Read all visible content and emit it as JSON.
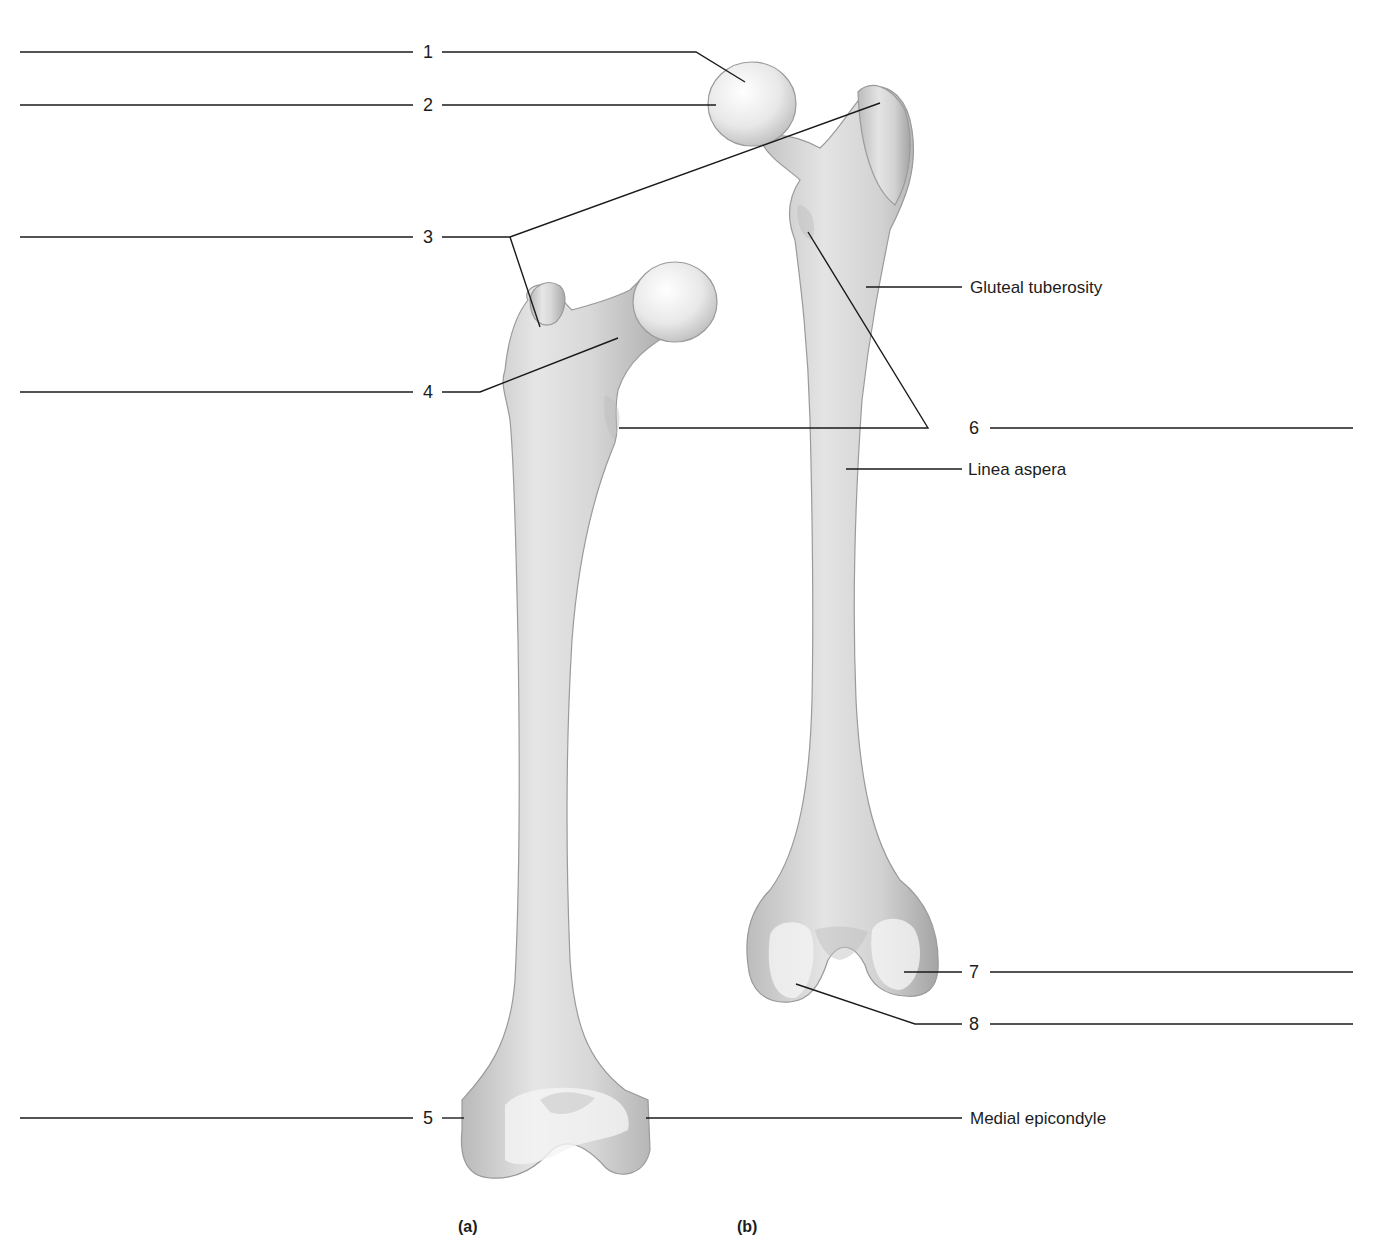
{
  "figure": {
    "panels": [
      {
        "id": "a",
        "caption": "(a)",
        "view": "anterior femur"
      },
      {
        "id": "b",
        "caption": "(b)",
        "view": "posterior femur"
      }
    ],
    "numbered_labels": [
      {
        "number": "1",
        "answer_blank": ""
      },
      {
        "number": "2",
        "answer_blank": ""
      },
      {
        "number": "3",
        "answer_blank": ""
      },
      {
        "number": "4",
        "answer_blank": ""
      },
      {
        "number": "5",
        "answer_blank": ""
      },
      {
        "number": "6",
        "answer_blank": ""
      },
      {
        "number": "7",
        "answer_blank": ""
      },
      {
        "number": "8",
        "answer_blank": ""
      }
    ],
    "named_labels": [
      {
        "text": "Gluteal tuberosity"
      },
      {
        "text": "Linea aspera"
      },
      {
        "text": "Medial epicondyle"
      }
    ]
  }
}
